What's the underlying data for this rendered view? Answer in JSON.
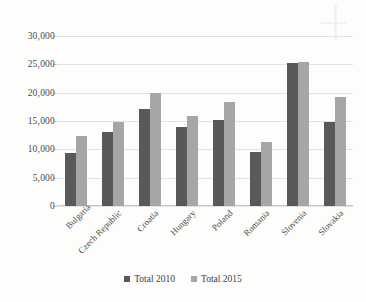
{
  "chart_data": {
    "type": "bar",
    "title": "",
    "xlabel": "",
    "ylabel": "",
    "ylim": [
      0,
      30000
    ],
    "yticks": [
      0,
      5000,
      10000,
      15000,
      20000,
      25000,
      30000
    ],
    "ytick_labels": [
      "0",
      "5,000",
      "10,000",
      "15,000",
      "20,000",
      "25,000",
      "30,000"
    ],
    "grid": true,
    "legend_position": "bottom-center",
    "categories": [
      "Bulgaria",
      "Czech Republic",
      "Croatia",
      "Hungary",
      "Poland",
      "Romania",
      "Slovenia",
      "Slovakia"
    ],
    "series": [
      {
        "name": "Total 2010",
        "color": "#595959",
        "values": [
          9400,
          13100,
          17200,
          13900,
          15100,
          9600,
          25300,
          14900
        ]
      },
      {
        "name": "Total 2015",
        "color": "#a6a6a6",
        "values": [
          12400,
          14900,
          20000,
          15800,
          18300,
          11300,
          25500,
          19200
        ]
      }
    ]
  },
  "legend": {
    "items": [
      {
        "label": "Total 2010"
      },
      {
        "label": "Total 2015"
      }
    ]
  }
}
